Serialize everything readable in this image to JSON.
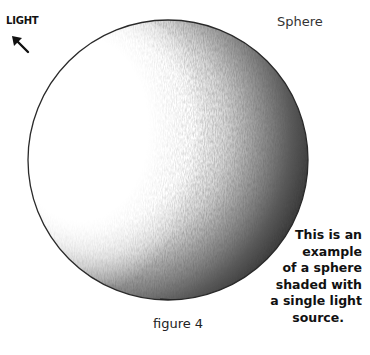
{
  "title": "Sphere",
  "light": {
    "label": "LIGHT",
    "icon": "arrow-up-left-icon"
  },
  "caption": {
    "lines": [
      "This is an",
      "example",
      "of a sphere",
      "shaded with",
      "a single light",
      "source."
    ]
  },
  "figure_label": "figure 4",
  "colors": {
    "background": "#ffffff",
    "outline": "#2a2a2a",
    "shadow_dark": "#1e1e1e",
    "shadow_mid": "#777777",
    "highlight": "#ffffff"
  }
}
